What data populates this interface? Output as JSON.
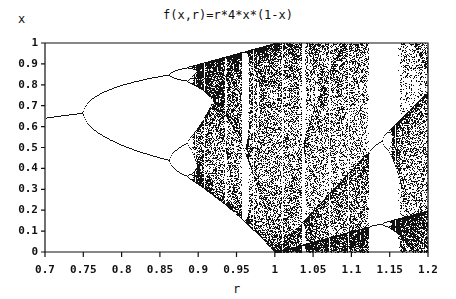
{
  "chart_data": {
    "type": "scatter",
    "title": "f(x,r)=r*4*x*(1-x)",
    "xlabel": "r",
    "ylabel": "x",
    "xlim": [
      0.7,
      1.2
    ],
    "ylim": [
      0,
      1
    ],
    "x_ticks": [
      "0.7",
      "0.75",
      "0.8",
      "0.85",
      "0.9",
      "0.95",
      "1",
      "1.05",
      "1.1",
      "1.15",
      "1.2"
    ],
    "y_ticks": [
      "0",
      "0.1",
      "0.2",
      "0.3",
      "0.4",
      "0.5",
      "0.6",
      "0.7",
      "0.8",
      "0.9",
      "1"
    ],
    "grid": false,
    "key_points": [
      {
        "r": 0.7,
        "x": 0.643
      },
      {
        "r": 0.75,
        "x": 0.667
      },
      {
        "r": 0.85,
        "x_upper": 0.81,
        "x_lower": 0.44
      },
      {
        "r": 0.96,
        "window": "period-3"
      }
    ]
  }
}
